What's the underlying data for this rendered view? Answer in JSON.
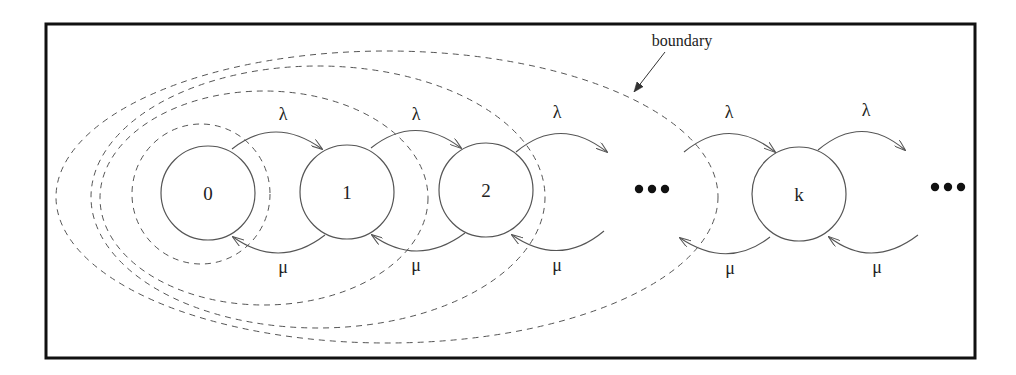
{
  "diagram": {
    "type": "birth-death markov chain state diagram",
    "states": [
      {
        "label": "0"
      },
      {
        "label": "1"
      },
      {
        "label": "2"
      },
      {
        "label": "k"
      }
    ],
    "ellipsis": [
      "•••",
      "•••"
    ],
    "arrival_rate_label": "λ",
    "service_rate_label": "μ",
    "arrival_labels": [
      "λ",
      "λ",
      "λ",
      "λ",
      "λ"
    ],
    "service_labels": [
      "μ",
      "μ",
      "μ",
      "μ",
      "μ"
    ],
    "boundary_annotation": "boundary",
    "boundaries_count": 4,
    "colors": {
      "line": "#555555",
      "frame": "#111111",
      "background": "#ffffff"
    }
  }
}
